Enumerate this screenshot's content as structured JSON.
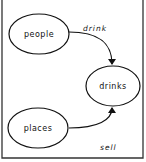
{
  "diagram": {
    "type": "concept-map",
    "nodes": [
      {
        "id": "people",
        "label": "people",
        "cx": 39,
        "cy": 34,
        "rx": 30,
        "ry": 20
      },
      {
        "id": "drinks",
        "label": "drinks",
        "cx": 113,
        "cy": 86,
        "rx": 27,
        "ry": 20
      },
      {
        "id": "places",
        "label": "places",
        "cx": 38,
        "cy": 128,
        "rx": 30,
        "ry": 20
      }
    ],
    "edges": [
      {
        "from": "people",
        "to": "drinks",
        "label": "drink"
      },
      {
        "from": "places",
        "to": "drinks",
        "label": "sell"
      }
    ],
    "colors": {
      "stroke": "#111111",
      "background": "#ffffff",
      "frame": "#333333"
    }
  }
}
